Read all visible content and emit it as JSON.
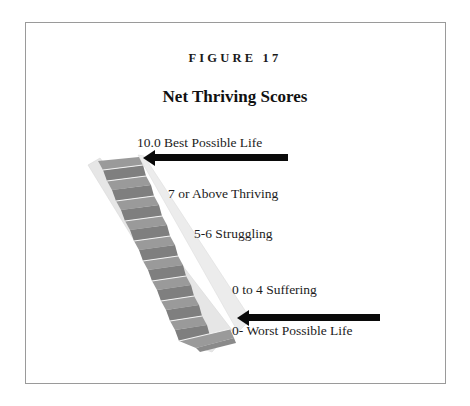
{
  "figure": {
    "label": "FIGURE 17",
    "title": "Net Thriving Scores"
  },
  "diagram": {
    "type": "staircase-scale",
    "steps_count": 11,
    "labels": {
      "best": "10.0 Best Possible Life",
      "thriving": "7 or Above Thriving",
      "struggling": "5-6 Struggling",
      "suffering": "0 to 4 Suffering",
      "worst": "0- Worst Possible Life"
    },
    "arrows": [
      {
        "name": "top-arrow",
        "points_to": "top step",
        "direction": "left"
      },
      {
        "name": "bottom-arrow",
        "points_to": "bottom step",
        "direction": "left"
      }
    ],
    "colors": {
      "arrow": "#0a0a0a",
      "step_tread": "#8f8f8f",
      "step_riser": "#a8a8a8",
      "stringer": "#e2e2e2",
      "border": "#9a9a9a"
    }
  }
}
